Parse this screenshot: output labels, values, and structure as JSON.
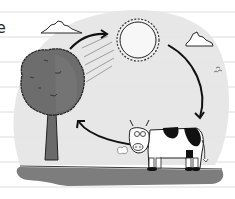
{
  "figure": {
    "edge_text": "e",
    "nodes": [
      {
        "id": "sun",
        "label": "sun"
      },
      {
        "id": "tree",
        "label": "tree"
      },
      {
        "id": "cow",
        "label": "cow"
      }
    ],
    "arrows": [
      {
        "from": "tree",
        "to": "sun"
      },
      {
        "from": "sun",
        "to": "cow"
      },
      {
        "from": "cow",
        "to": "tree"
      }
    ],
    "colors": {
      "paper": "#ffffff",
      "rule_line": "#d8d8d8",
      "backdrop": "#e6e6e6",
      "ground": "#7a7a7a",
      "tree_canopy": "#6b6b6b",
      "ink": "#1a1a1a"
    }
  }
}
